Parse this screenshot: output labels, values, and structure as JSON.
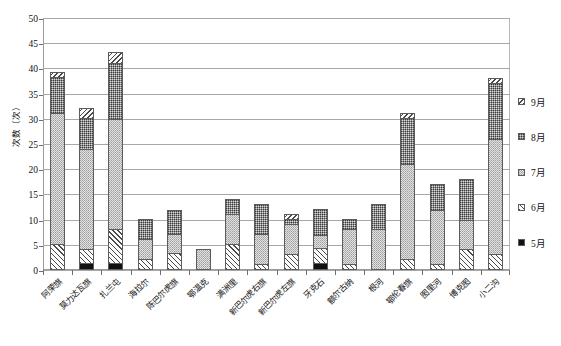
{
  "chart_data": {
    "type": "bar",
    "subtype": "stacked-bar",
    "title": "",
    "xlabel": "",
    "ylabel": "次数（次）",
    "ylim": [
      0,
      50
    ],
    "ytick_step": 5,
    "yticks": [
      0,
      5,
      10,
      15,
      20,
      25,
      30,
      35,
      40,
      45,
      50
    ],
    "grid": "horizontal",
    "legend_position": "right",
    "categories": [
      "阿荣旗",
      "莫力达瓦旗",
      "扎兰屯",
      "海拉尔",
      "陈巴尔虎旗",
      "鄂温克",
      "满洲里",
      "新巴尔虎右旗",
      "新巴尔虎左旗",
      "牙克石",
      "额尔古纳",
      "根河",
      "鄂伦春旗",
      "图里河",
      "博克图",
      "小二沟"
    ],
    "series": [
      {
        "name": "5月",
        "pattern": "solid-black",
        "values": [
          0,
          1.0,
          1.0,
          0,
          0,
          0,
          0,
          0,
          0,
          1.0,
          0,
          0,
          0,
          0,
          0,
          0
        ]
      },
      {
        "name": "6月",
        "pattern": "diagonal-hatch-forward",
        "values": [
          4.8,
          2.8,
          6.8,
          1.8,
          2.9,
          0,
          4.8,
          0.7,
          2.8,
          3.0,
          0.7,
          0,
          1.8,
          0.8,
          3.8,
          2.8
        ]
      },
      {
        "name": "7月",
        "pattern": "light-stipple",
        "values": [
          26.0,
          19.8,
          21.8,
          3.9,
          3.9,
          3.8,
          5.9,
          6.0,
          6.0,
          2.5,
          7.0,
          7.7,
          18.8,
          10.8,
          5.8,
          22.7
        ]
      },
      {
        "name": "8月",
        "pattern": "dark-stipple",
        "values": [
          7.2,
          6.2,
          11.0,
          4.1,
          4.8,
          0,
          3.0,
          6.0,
          0.9,
          5.2,
          2.0,
          5.0,
          9.2,
          5.1,
          8.1,
          11.3
        ]
      },
      {
        "name": "9月",
        "pattern": "diagonal-hatch-back",
        "values": [
          0.8,
          1.9,
          2.2,
          0,
          0,
          0,
          0,
          0,
          1.0,
          0,
          0,
          0,
          0.9,
          0,
          0,
          0.9
        ]
      }
    ],
    "totals": [
      38.8,
      31.7,
      42.8,
      9.8,
      11.6,
      3.8,
      13.7,
      12.7,
      10.7,
      11.7,
      9.7,
      12.7,
      30.7,
      16.7,
      17.7,
      37.7
    ]
  },
  "legend": {
    "items": [
      {
        "label": "9月",
        "series_index": 4
      },
      {
        "label": "8月",
        "series_index": 3
      },
      {
        "label": "7月",
        "series_index": 2
      },
      {
        "label": "6月",
        "series_index": 1
      },
      {
        "label": "5月",
        "series_index": 0
      }
    ]
  },
  "colors": {
    "axis": "#9a9a9a",
    "gridline": "#a8a8a8",
    "bar_outline": "#5c5c5c",
    "text": "#111111",
    "background": "#ffffff",
    "m5": "#111111",
    "m6": "#fcfcfc",
    "m7": "#e2e2e2",
    "m8": "#8d8d8d",
    "m9": "#fbfbfb"
  }
}
